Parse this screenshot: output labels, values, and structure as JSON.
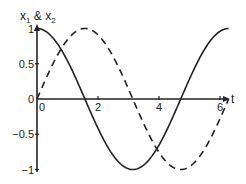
{
  "chart_data": {
    "type": "line",
    "title": "",
    "xlabel": "t",
    "ylabel": "x1 & x2",
    "ylabel_parts": {
      "main": "x",
      "sub1": "1",
      "amp": " & x",
      "sub2": "2"
    },
    "xlim": [
      0,
      6.3
    ],
    "ylim": [
      -1,
      1
    ],
    "x_ticks": [
      0,
      2,
      4,
      6
    ],
    "x_tick_labels": [
      "0",
      "2",
      "4",
      "6"
    ],
    "y_ticks": [
      -1,
      -0.5,
      0,
      0.5,
      1
    ],
    "y_tick_labels": [
      "−1",
      "−0.5",
      "0",
      "0.5",
      "1"
    ],
    "grid": false,
    "legend": null,
    "series": [
      {
        "name": "x1",
        "style": "solid",
        "color": "#222222",
        "x": [
          0,
          0.5,
          1.0,
          1.5,
          2.0,
          2.5,
          3.0,
          3.5,
          4.0,
          4.5,
          5.0,
          5.5,
          6.0,
          6.28
        ],
        "values": [
          1.0,
          0.88,
          0.54,
          0.07,
          -0.42,
          -0.8,
          -0.99,
          -0.94,
          -0.65,
          -0.21,
          0.28,
          0.71,
          0.96,
          1.0
        ]
      },
      {
        "name": "x2",
        "style": "dashed",
        "color": "#222222",
        "x": [
          0,
          0.5,
          1.0,
          1.5,
          2.0,
          2.5,
          3.0,
          3.5,
          4.0,
          4.5,
          5.0,
          5.5,
          6.0,
          6.28
        ],
        "values": [
          0.0,
          0.48,
          0.84,
          1.0,
          0.91,
          0.6,
          0.14,
          -0.35,
          -0.76,
          -0.98,
          -0.96,
          -0.71,
          -0.28,
          0.0
        ]
      }
    ]
  }
}
